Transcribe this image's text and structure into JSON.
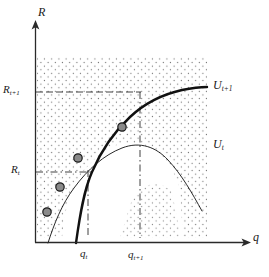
{
  "figure": {
    "type": "economics-diagram",
    "background_color": "#ffffff",
    "ink_color": "#1a1a1a"
  },
  "axes": {
    "y_axis": {
      "name": "R",
      "label_main": "R",
      "label_sub": "",
      "arrow": "up"
    },
    "x_axis": {
      "name": "q",
      "label_main": "q",
      "label_sub": "",
      "arrow": "right"
    }
  },
  "ticks": {
    "y": [
      {
        "id": "R_t",
        "label_main": "R",
        "label_sub": "t",
        "value_px": 172
      },
      {
        "id": "R_t+1",
        "label_main": "R",
        "label_sub": "t+1",
        "value_px": 92
      }
    ],
    "x": [
      {
        "id": "q_t",
        "label_main": "q",
        "label_sub": "t",
        "value_px": 88
      },
      {
        "id": "q_t+1",
        "label_main": "q",
        "label_sub": "t+1",
        "value_px": 140
      }
    ]
  },
  "curves": [
    {
      "id": "U_t1",
      "label_main": "U",
      "label_sub": "t+1",
      "stroke": "#111111",
      "width": 2.4,
      "shape": "increasing-concave-saturating"
    },
    {
      "id": "U_t",
      "label_main": "U",
      "label_sub": "t",
      "stroke": "#111111",
      "width": 0.9,
      "shape": "inverted-u-hump"
    }
  ],
  "data_points": {
    "name": "observation-dots",
    "marker": {
      "fill": "#8a8a8a",
      "stroke": "#1a1a1a",
      "radius": 4.2
    },
    "points": [
      {
        "cx": 47,
        "cy": 212
      },
      {
        "cx": 60,
        "cy": 187
      },
      {
        "cx": 78,
        "cy": 158
      },
      {
        "cx": 122,
        "cy": 127
      }
    ]
  },
  "guides": {
    "horizontal_dashed": [
      {
        "id": "R_t-guide",
        "y": 172,
        "x1": 36,
        "x2": 92,
        "style": "dash-dot"
      },
      {
        "id": "R_t+1-guide",
        "y": 92,
        "x1": 36,
        "x2": 141,
        "style": "dashed"
      }
    ],
    "vertical_dashdot": [
      {
        "id": "q_t-guide",
        "x": 88,
        "y1": 172,
        "y2": 238,
        "style": "dash-dot"
      },
      {
        "id": "q_t+1-guide",
        "x": 140,
        "y1": 92,
        "y2": 238,
        "style": "dash-dot"
      }
    ]
  },
  "shaded_region": {
    "name": "stippled-feasible-region",
    "pattern": "dot-stipple",
    "dot_color": "#6e6e6e",
    "bounds": {
      "x1": 37,
      "y1": 57,
      "x2": 207,
      "y2": 238
    },
    "cutout": "white lens region bounded above by U_t curve and below-left by rising branch"
  }
}
